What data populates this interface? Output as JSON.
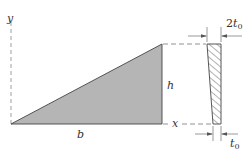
{
  "diagram": {
    "type": "triangular plate with tapered cross-section",
    "labels": {
      "y_axis": "y",
      "height": "h",
      "base": "b",
      "x_coord": "x",
      "top_thickness_coef": "2",
      "thickness_symbol": "t",
      "thickness_subscript": "0",
      "bottom_thickness_symbol": "t",
      "bottom_thickness_subscript": "0"
    },
    "colors": {
      "fill": "#b3b3b3",
      "stroke": "#444444",
      "dash": "#777777",
      "hatch": "#666666"
    }
  }
}
